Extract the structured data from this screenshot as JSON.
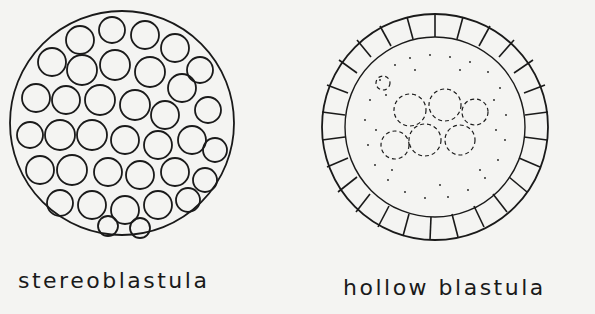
{
  "figure": {
    "panels": [
      {
        "id": "stereoblastula",
        "label": "stereoblastula",
        "description": "solid ball of cells, no cavity"
      },
      {
        "id": "hollow-blastula",
        "label": "hollow blastula",
        "description": "single cell layer surrounding a stippled cavity (blastocoel)"
      }
    ],
    "colors": {
      "background": "#f4f4f2",
      "ink": "#1a1a1a"
    }
  }
}
